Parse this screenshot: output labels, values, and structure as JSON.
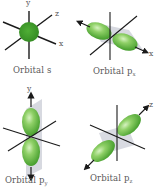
{
  "diagram": {
    "colors": {
      "lobe": "#5cb33a",
      "lobe_highlight": "#b8e59a",
      "sphere": "#3e9a2c",
      "plane": "#c9ccd6",
      "axis": "#1a1a1a",
      "text": "#5a5a5a"
    },
    "panels": [
      {
        "id": "s",
        "caption_main": "Orbital s",
        "caption_sub": "",
        "axis_labels": {
          "y": "y",
          "z": "z",
          "x": "x"
        }
      },
      {
        "id": "px",
        "caption_main": "Orbital p",
        "caption_sub": "x",
        "axis_labels": {
          "x": "x"
        }
      },
      {
        "id": "py",
        "caption_main": "Orbital p",
        "caption_sub": "y",
        "axis_labels": {
          "y": "y"
        }
      },
      {
        "id": "pz",
        "caption_main": "Orbital p",
        "caption_sub": "z",
        "axis_labels": {
          "z": "z"
        }
      }
    ]
  }
}
